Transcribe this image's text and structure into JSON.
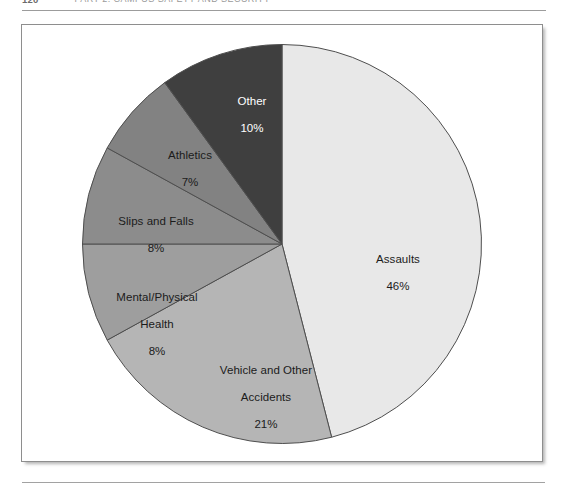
{
  "page": {
    "folio": "120",
    "running_head": "PART 2:  CAMPUS SAFETY AND SECURITY"
  },
  "figure": {
    "background_color": "#ffffff",
    "border_color": "#8e8e8e"
  },
  "chart_data": {
    "type": "pie",
    "title": "",
    "subtitle": "",
    "xlabel": "",
    "ylabel": "",
    "grid": false,
    "legend_position": "none",
    "label_style": "inside-slice-with-percent",
    "start_angle_deg": 0,
    "direction": "clockwise",
    "total_percent": 100,
    "categories": [
      "Assaults",
      "Vehicle and Other Accidents",
      "Mental/Physical Health",
      "Slips and Falls",
      "Athletics",
      "Other"
    ],
    "values": [
      46,
      21,
      8,
      8,
      7,
      10
    ],
    "value_labels": [
      "46%",
      "21%",
      "8%",
      "8%",
      "7%",
      "10%"
    ],
    "colors": [
      "#e8e8e8",
      "#b5b5b5",
      "#9e9e9e",
      "#8c8c8c",
      "#828282",
      "#3f3f3f"
    ],
    "slices": [
      {
        "name": "Assaults",
        "value": 46,
        "value_label": "46%",
        "color": "#e8e8e8",
        "label_line1": "Assaults",
        "label_line2": "46%",
        "label_on_dark": false
      },
      {
        "name": "Vehicle and Other Accidents",
        "value": 21,
        "value_label": "21%",
        "color": "#b5b5b5",
        "label_line1": "Vehicle and Other",
        "label_line2": "Accidents",
        "label_line3": "21%",
        "label_on_dark": false
      },
      {
        "name": "Mental/Physical Health",
        "value": 8,
        "value_label": "8%",
        "color": "#9e9e9e",
        "label_line1": "Mental/Physical",
        "label_line2": "Health",
        "label_line3": "8%",
        "label_on_dark": false
      },
      {
        "name": "Slips and Falls",
        "value": 8,
        "value_label": "8%",
        "color": "#8c8c8c",
        "label_line1": "Slips and Falls",
        "label_line2": "8%",
        "label_on_dark": false
      },
      {
        "name": "Athletics",
        "value": 7,
        "value_label": "7%",
        "color": "#828282",
        "label_line1": "Athletics",
        "label_line2": "7%",
        "label_on_dark": false
      },
      {
        "name": "Other",
        "value": 10,
        "value_label": "10%",
        "color": "#3f3f3f",
        "label_line1": "Other",
        "label_line2": "10%",
        "label_on_dark": true
      }
    ]
  }
}
